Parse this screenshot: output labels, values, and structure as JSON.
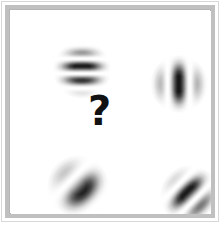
{
  "stage": {
    "width": 222,
    "height": 225,
    "background_color": "#ffffff",
    "frame_color": "#c0c0c0",
    "frame_outer_color": "#d8d8d8"
  },
  "center_prompt": {
    "glyph": "?",
    "name": "question-mark",
    "color": "#111111",
    "x": 88,
    "y": 91,
    "font_size": 40
  },
  "chart_data": {
    "type": "scatter",
    "title": "",
    "xlabel": "",
    "ylabel": "",
    "grid": false,
    "legend": null,
    "panel": {
      "x": 11,
      "y": 11,
      "width": 200,
      "height": 203
    },
    "series": [
      {
        "name": "gabor-patches",
        "points": [
          {
            "id": "top-left",
            "label": "vertical grating",
            "cx": 51,
            "cy": 39,
            "size": 62,
            "orientation_deg": 0,
            "stripe_angle_deg": 90,
            "cycles": 7.5,
            "contrast": 0.9,
            "color": "#000000"
          },
          {
            "id": "top-right",
            "label": "horizontal grating",
            "cx": 148,
            "cy": 53,
            "size": 62,
            "orientation_deg": 90,
            "stripe_angle_deg": 0,
            "cycles": 5.0,
            "contrast": 0.92,
            "color": "#000000"
          },
          {
            "id": "bottom-left",
            "label": "diagonal grating 45 degrees",
            "cx": 45,
            "cy": 153,
            "size": 66,
            "orientation_deg": 45,
            "stripe_angle_deg": 45,
            "cycles": 3.2,
            "contrast": 0.88,
            "color": "#000000"
          },
          {
            "id": "bottom-right",
            "label": "diagonal grating 45 degrees",
            "cx": 158,
            "cy": 163,
            "size": 64,
            "orientation_deg": 45,
            "stripe_angle_deg": 45,
            "cycles": 5.2,
            "contrast": 0.9,
            "color": "#000000"
          }
        ]
      }
    ],
    "annotations": [
      {
        "text": "?",
        "x": 100,
        "y": 110,
        "role": "missing-item-placeholder"
      }
    ]
  }
}
